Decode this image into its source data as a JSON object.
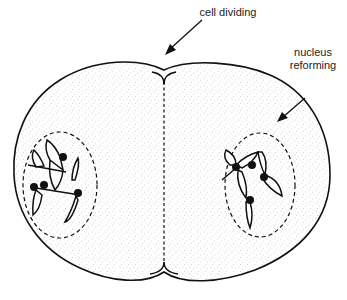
{
  "diagram": {
    "labels": {
      "cell_dividing": "cell dividing",
      "nucleus_reforming_line1": "nucleus",
      "nucleus_reforming_line2": "reforming"
    },
    "colors": {
      "outline": "#111111",
      "cytoplasm_stipple": "#9a9a9a",
      "background": "#ffffff"
    }
  }
}
